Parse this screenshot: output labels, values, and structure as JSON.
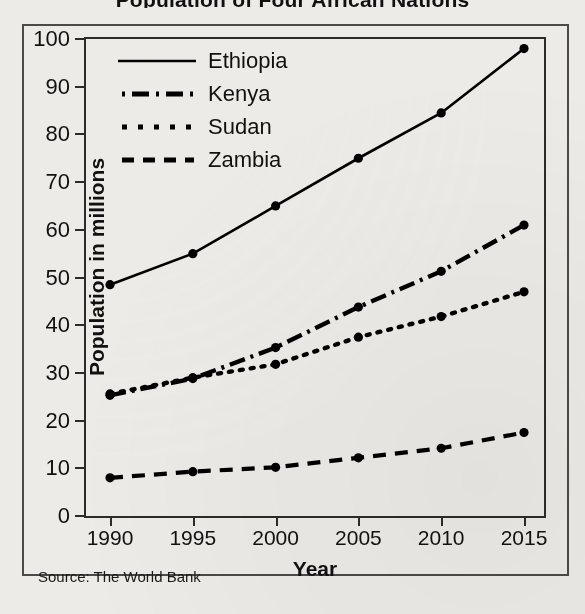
{
  "title": "Population of Four African Nations",
  "source_note": "Source: The World Bank",
  "axis": {
    "x_title": "Year",
    "y_title": "Population in millions",
    "x_ticks": [
      "1990",
      "1995",
      "2000",
      "2005",
      "2010",
      "2015"
    ],
    "y_ticks": [
      "0",
      "10",
      "20",
      "30",
      "40",
      "50",
      "60",
      "70",
      "80",
      "90",
      "100"
    ]
  },
  "legend": {
    "items": [
      {
        "label": "Ethiopia",
        "style": "solid"
      },
      {
        "label": "Kenya",
        "style": "dash-dot"
      },
      {
        "label": "Sudan",
        "style": "dotted"
      },
      {
        "label": "Zambia",
        "style": "dashed"
      }
    ]
  },
  "chart_data": {
    "type": "line",
    "title": "Population of Four African Nations",
    "xlabel": "Year",
    "ylabel": "Population in millions",
    "categories": [
      1990,
      1995,
      2000,
      2005,
      2010,
      2015
    ],
    "xlim": [
      1990,
      2015
    ],
    "ylim": [
      0,
      100
    ],
    "ytick_step": 10,
    "grid": false,
    "legend_position": "upper-left-inside",
    "markers": "filled-circle",
    "color": "#000000",
    "source": "Source: The World Bank",
    "series": [
      {
        "name": "Ethiopia",
        "style": "solid",
        "values": [
          48.5,
          55.0,
          65.0,
          75.0,
          84.5,
          98.0
        ]
      },
      {
        "name": "Kenya",
        "style": "dash-dot",
        "values": [
          25.3,
          28.8,
          35.3,
          43.8,
          51.3,
          61.0
        ]
      },
      {
        "name": "Sudan",
        "style": "dotted",
        "values": [
          25.6,
          29.0,
          31.8,
          37.5,
          41.8,
          47.0
        ]
      },
      {
        "name": "Zambia",
        "style": "dashed",
        "values": [
          8.0,
          9.3,
          10.2,
          12.2,
          14.2,
          17.5
        ]
      }
    ]
  }
}
